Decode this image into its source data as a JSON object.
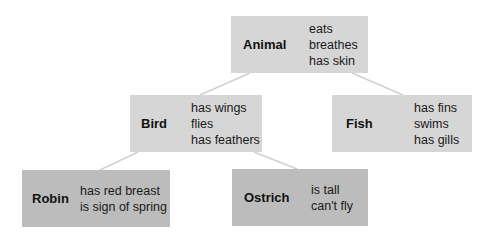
{
  "diagram": {
    "type": "hierarchy",
    "nodes": [
      {
        "id": "animal",
        "name": "Animal",
        "properties": [
          "eats",
          "breathes",
          "has skin"
        ]
      },
      {
        "id": "bird",
        "name": "Bird",
        "properties": [
          "has wings",
          "flies",
          "has feathers"
        ]
      },
      {
        "id": "fish",
        "name": "Fish",
        "properties": [
          "has fins",
          "swims",
          "has gills"
        ]
      },
      {
        "id": "robin",
        "name": "Robin",
        "properties": [
          "has red breast",
          "is sign of spring"
        ]
      },
      {
        "id": "ostrich",
        "name": "Ostrich",
        "properties": [
          "is tall",
          "can't fly"
        ]
      }
    ],
    "edges": [
      {
        "from": "animal",
        "to": "bird"
      },
      {
        "from": "animal",
        "to": "fish"
      },
      {
        "from": "bird",
        "to": "robin"
      },
      {
        "from": "bird",
        "to": "ostrich"
      }
    ],
    "colors": {
      "level1_2_fill": "#d6d6d6",
      "level3_fill": "#bcbcbc",
      "edge": "#d0d0d0"
    }
  }
}
